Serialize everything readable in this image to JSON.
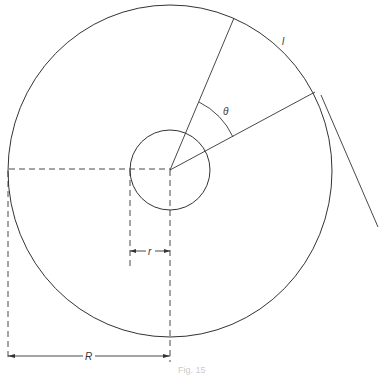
{
  "figure": {
    "labels": {
      "arc_length": "l",
      "angle": "θ",
      "inner_radius": "r",
      "outer_radius": "R"
    },
    "caption": "Fig. 15",
    "colors": {
      "stroke": "#333333",
      "background": "#ffffff"
    }
  }
}
